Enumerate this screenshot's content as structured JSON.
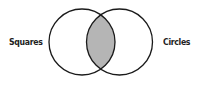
{
  "diagram": {
    "type": "venn",
    "sets": [
      {
        "label": "Squares",
        "cx": 82,
        "cy": 42,
        "r": 33
      },
      {
        "label": "Circles",
        "cx": 119.5,
        "cy": 42,
        "r": 33
      }
    ],
    "intersection": {
      "fill": "#b5b5b5",
      "label": ""
    },
    "stroke_color": "#1a1a1a",
    "background": "#ffffff"
  }
}
